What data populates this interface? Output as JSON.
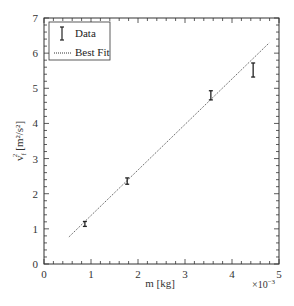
{
  "chart_data": {
    "type": "scatter",
    "title": "",
    "xlabel": "m [kg]",
    "ylabel": "v_f^2 [m^2/s^2]",
    "x_multiplier": "×10^-3",
    "xlim": [
      0,
      5
    ],
    "ylim": [
      0,
      7
    ],
    "xticks": [
      "0",
      "1",
      "2",
      "3",
      "4",
      "5"
    ],
    "yticks": [
      "0",
      "1",
      "2",
      "3",
      "4",
      "5",
      "6",
      "7"
    ],
    "grid": false,
    "legend_position": "upper left",
    "series": [
      {
        "name": "Data",
        "style": "errorbar",
        "x": [
          0.87,
          1.77,
          3.55,
          4.45
        ],
        "y": [
          1.14,
          2.36,
          4.8,
          5.52
        ],
        "yerr": [
          0.07,
          0.09,
          0.13,
          0.2
        ]
      },
      {
        "name": "Best Fit",
        "style": "dotted-line",
        "x": [
          0.53,
          4.79
        ],
        "y": [
          0.77,
          6.29
        ]
      }
    ]
  },
  "legend": {
    "data_label": "Data",
    "fit_label": "Best Fit"
  },
  "axes": {
    "xlabel": "m [kg]",
    "multiplier_base": "×10",
    "multiplier_exp": "−3",
    "ylabel_main": "v",
    "ylabel_sub": "f",
    "ylabel_sup": "2",
    "ylabel_units": "[m²/s²]"
  }
}
